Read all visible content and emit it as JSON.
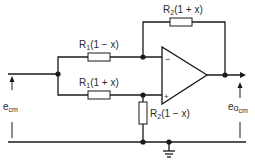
{
  "diagram": {
    "type": "op-amp differential amplifier (common-mode rejection circuit)",
    "components": {
      "r1_top": {
        "name": "R",
        "sub": "1",
        "value": "(1 − x)"
      },
      "r1_bottom": {
        "name": "R",
        "sub": "1",
        "value": "(1 + x)"
      },
      "r2_feedback": {
        "name": "R",
        "sub": "2",
        "value": "(1 + x)"
      },
      "r2_ground": {
        "name": "R",
        "sub": "2",
        "value": "(1 − x)"
      },
      "opamp": {
        "inverting": "−",
        "noninverting": "+"
      }
    },
    "signals": {
      "input": {
        "name": "e",
        "sub": "cm"
      },
      "output": {
        "name": "e",
        "sub_o": "o",
        "sub": "cm"
      }
    },
    "colors": {
      "line": "#1a1a1a",
      "background": "#ffffff",
      "text": "#2a2a2a"
    }
  }
}
